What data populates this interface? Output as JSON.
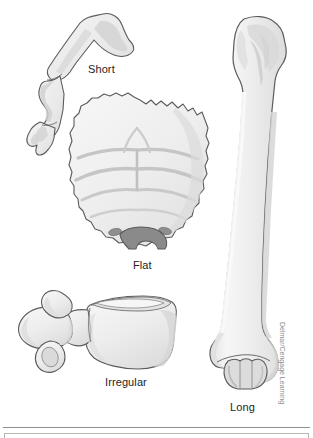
{
  "figure": {
    "background_color": "#ffffff",
    "canvas": {
      "width": 313,
      "height": 438
    }
  },
  "labels": {
    "short": "Short",
    "flat": "Flat",
    "irregular": "Irregular",
    "long": "Long"
  },
  "credit": {
    "text": "Delmar/Cengage Learning"
  },
  "palette": {
    "outline": "#5b5b5b",
    "bone_fill_light": "#f4f4f4",
    "bone_fill": "#ededed",
    "bone_shade": "#d8d8d8",
    "bone_shade_dark": "#bdbdbd",
    "foramen_dark": "#8a8a8a",
    "label_text": "#1d1d1d",
    "credit_text": "#8c8c8c",
    "rule": "#8f8f8f"
  },
  "illustrations": {
    "short_bone": {
      "name": "phalanx / short bone",
      "position": "top-left"
    },
    "flat_bone": {
      "name": "occipital bone with foramen magnum",
      "position": "center"
    },
    "irregular_bone": {
      "name": "lumbar vertebra",
      "position": "bottom-left"
    },
    "long_bone": {
      "name": "humerus",
      "position": "right"
    }
  }
}
